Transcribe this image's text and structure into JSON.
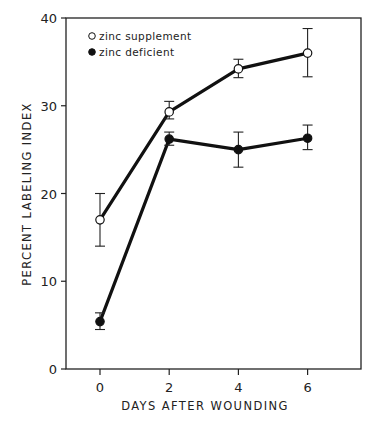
{
  "chart_data": {
    "type": "line",
    "title": "",
    "xlabel": "DAYS AFTER WOUNDING",
    "ylabel": "PERCENT LABELING INDEX",
    "x": [
      0,
      2,
      4,
      6
    ],
    "xticks": [
      "0",
      "2",
      "4",
      "6"
    ],
    "yticks": [
      "0",
      "10",
      "20",
      "30",
      "40"
    ],
    "ylim": [
      0,
      40
    ],
    "xlim": [
      -1,
      7.5
    ],
    "grid": false,
    "legend_position": "upper left",
    "series": [
      {
        "name": "zinc supplement",
        "marker": "open-circle",
        "values": [
          17,
          29.3,
          34.2,
          36
        ],
        "err_low": [
          14,
          28.5,
          33.2,
          33.3
        ],
        "err_high": [
          20,
          30.5,
          35.3,
          38.8
        ]
      },
      {
        "name": "zinc deficient",
        "marker": "filled-circle",
        "values": [
          5.4,
          26.2,
          25,
          26.3
        ],
        "err_low": [
          4.5,
          25.5,
          23,
          25
        ],
        "err_high": [
          6.4,
          27,
          27,
          27.8
        ]
      }
    ]
  }
}
